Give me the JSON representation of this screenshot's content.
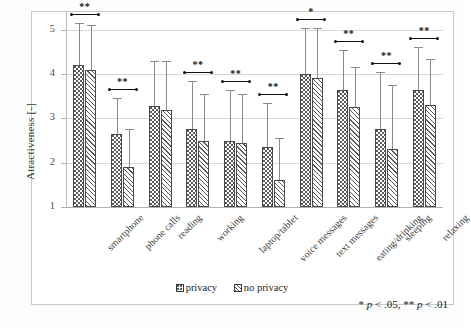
{
  "chart_data": {
    "type": "bar",
    "title": "",
    "xlabel": "",
    "ylabel": "Atractiveness [-]",
    "ylim": [
      1,
      5.4
    ],
    "yticks": [
      1,
      2,
      3,
      4,
      5
    ],
    "grid": true,
    "legend_position": "bottom-center",
    "categories": [
      "smartphone",
      "phone calls",
      "reading",
      "working",
      "laptop/tablet",
      "voice messages",
      "text messages",
      "eating/drinking",
      "sleeping",
      "relaxing"
    ],
    "series": [
      {
        "name": "privacy",
        "values": [
          4.2,
          2.65,
          3.27,
          2.75,
          2.5,
          2.35,
          4.0,
          3.65,
          2.75,
          3.65
        ],
        "err_upper": [
          5.15,
          3.45,
          4.3,
          3.85,
          3.65,
          3.35,
          5.05,
          4.55,
          4.05,
          4.6
        ],
        "err_lower": [
          3.25,
          1.85,
          2.24,
          1.65,
          1.35,
          1.35,
          2.95,
          2.75,
          1.45,
          2.7
        ]
      },
      {
        "name": "no privacy",
        "values": [
          4.1,
          1.9,
          3.2,
          2.5,
          2.45,
          1.6,
          3.9,
          3.25,
          2.3,
          3.3
        ],
        "err_upper": [
          5.1,
          2.75,
          4.3,
          3.55,
          3.55,
          2.55,
          5.05,
          4.15,
          3.75,
          4.35
        ],
        "err_lower": [
          3.1,
          1.05,
          2.1,
          1.45,
          1.35,
          0.65,
          2.75,
          2.35,
          0.85,
          2.25
        ]
      }
    ],
    "significance": [
      {
        "category": "smartphone",
        "marker": "**"
      },
      {
        "category": "phone calls",
        "marker": "**"
      },
      {
        "category": "reading",
        "marker": ""
      },
      {
        "category": "working",
        "marker": "**"
      },
      {
        "category": "laptop/tablet",
        "marker": "**"
      },
      {
        "category": "voice messages",
        "marker": "**"
      },
      {
        "category": "text messages",
        "marker": "*"
      },
      {
        "category": "eating/drinking",
        "marker": "**"
      },
      {
        "category": "sleeping",
        "marker": "**"
      },
      {
        "category": "relaxing",
        "marker": "**"
      }
    ],
    "annotations": {
      "footnote_plain_1": "* ",
      "footnote_italic_1": "p",
      "footnote_plain_2": " < .05, ** ",
      "footnote_italic_2": "p",
      "footnote_plain_3": " < .01"
    }
  },
  "legend": {
    "items": [
      {
        "label": "privacy"
      },
      {
        "label": "no privacy"
      }
    ]
  },
  "colors": {
    "bar_outline": "#4a4a4a",
    "error_bar": "#8a8a8a",
    "gridline": "#d9d9d9",
    "frame": "#c9c9c9",
    "text": "#3a3a3a"
  }
}
